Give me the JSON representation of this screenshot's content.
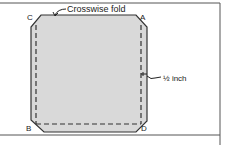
{
  "diagram": {
    "fold_label": "Crosswise fold",
    "measure_label": "½ inch",
    "corners": {
      "A": "A",
      "B": "B",
      "C": "C",
      "D": "D"
    },
    "colors": {
      "fill": "#d9d9d9",
      "stroke": "#333333",
      "frame": "#555555"
    }
  }
}
